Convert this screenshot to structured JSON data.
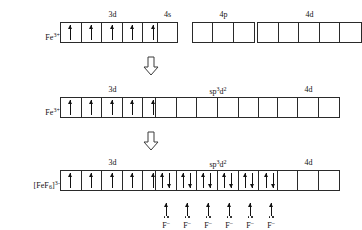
{
  "figure": {
    "background_color": "#ffffff",
    "line_color": "#2a2a2a",
    "text_color": "#111111"
  },
  "rows": [
    {
      "id": "row-fe3-ground",
      "species_label": "Fe",
      "species_charge": "3+",
      "groups": [
        {
          "id": "group-3d",
          "label": "3d",
          "label_sup": "",
          "box_count": 5,
          "occupancy": [
            "up",
            "up",
            "up",
            "up",
            "up"
          ]
        },
        {
          "id": "group-4s",
          "label": "4s",
          "label_sup": "",
          "box_count": 1,
          "occupancy": [
            "empty"
          ]
        },
        {
          "id": "group-4p",
          "label": "4p",
          "label_sup": "",
          "box_count": 3,
          "occupancy": [
            "empty",
            "empty",
            "empty"
          ]
        },
        {
          "id": "group-4d",
          "label": "4d",
          "label_sup": "",
          "box_count": 5,
          "occupancy": [
            "empty",
            "empty",
            "empty",
            "empty",
            "empty"
          ]
        }
      ],
      "ligands": []
    },
    {
      "id": "row-fe3-hybridised",
      "species_label": "Fe",
      "species_charge": "3+",
      "groups": [
        {
          "id": "group-3d",
          "label": "3d",
          "label_sup": "",
          "box_count": 5,
          "occupancy": [
            "up",
            "up",
            "up",
            "up",
            "up"
          ]
        },
        {
          "id": "group-sp3d2",
          "label": "sp",
          "label_sup": "3d2",
          "box_count": 6,
          "occupancy": [
            "empty",
            "empty",
            "empty",
            "empty",
            "empty",
            "empty"
          ]
        },
        {
          "id": "group-4d",
          "label": "4d",
          "label_sup": "",
          "box_count": 3,
          "occupancy": [
            "empty",
            "empty",
            "empty"
          ]
        }
      ],
      "ligands": []
    },
    {
      "id": "row-fef6-complex",
      "species_label": "[FeF6]",
      "species_charge": "3-",
      "groups": [
        {
          "id": "group-3d",
          "label": "3d",
          "label_sup": "",
          "box_count": 5,
          "occupancy": [
            "up",
            "up",
            "up",
            "up",
            "up"
          ]
        },
        {
          "id": "group-sp3d2",
          "label": "sp",
          "label_sup": "3d2",
          "box_count": 6,
          "occupancy": [
            "pair",
            "pair",
            "pair",
            "pair",
            "pair",
            "pair"
          ]
        },
        {
          "id": "group-4d",
          "label": "4d",
          "label_sup": "",
          "box_count": 3,
          "occupancy": [
            "empty",
            "empty",
            "empty"
          ]
        }
      ],
      "ligands": [
        "F",
        "F",
        "F",
        "F",
        "F",
        "F"
      ],
      "ligand_charge": "–"
    }
  ],
  "transition_arrows": [
    {
      "id": "transition-arrow-1",
      "direction": "down"
    },
    {
      "id": "transition-arrow-2",
      "direction": "down"
    }
  ],
  "geometry": {
    "row_tops": [
      10,
      85,
      158
    ],
    "group_lefts": [
      [
        60,
        157,
        192,
        257
      ],
      [
        60,
        155,
        277
      ],
      [
        60,
        155,
        277
      ]
    ],
    "transition_arrow_tops": [
      56,
      131
    ],
    "transition_arrow_left": 143,
    "cell_width": 21
  }
}
